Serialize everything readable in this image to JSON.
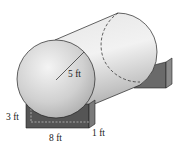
{
  "figure": {
    "type": "cylindrical tank on rectangular supports",
    "labels": {
      "radius": "5 ft",
      "support_height": "3 ft",
      "support_width": "8 ft",
      "support_depth": "1 ft"
    },
    "colors": {
      "tank_light": "#efefef",
      "tank_mid": "#c8c8c8",
      "tank_dark": "#9c9c9c",
      "support_front": "#555555",
      "support_side": "#7a7a7a",
      "support_top": "#9a9a9a",
      "outline": "#222222"
    }
  }
}
